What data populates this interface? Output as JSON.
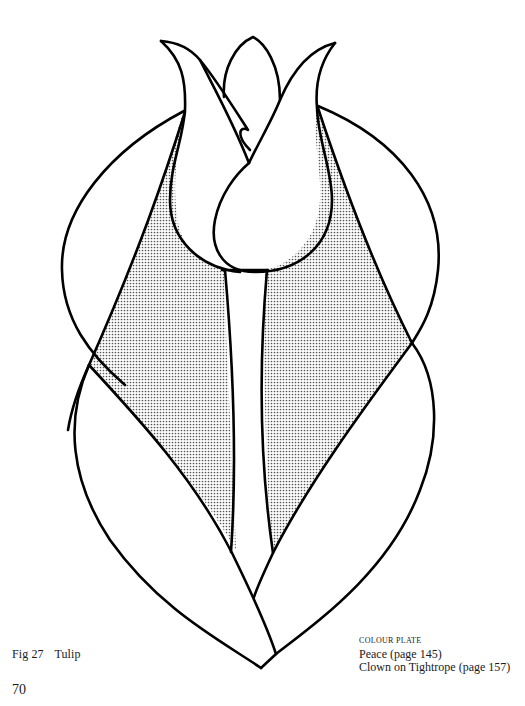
{
  "page": {
    "number": "70"
  },
  "figure": {
    "label": "Fig 27",
    "title": "Tulip",
    "type": "stained-glass pattern line drawing",
    "colors": {
      "line": "#000000",
      "shade": "#b8b8b8",
      "background": "#ffffff"
    }
  },
  "colour_plate": {
    "heading": "COLOUR PLATE",
    "items": [
      "Peace (page 145)",
      "Clown on Tightrope (page 157)"
    ]
  }
}
